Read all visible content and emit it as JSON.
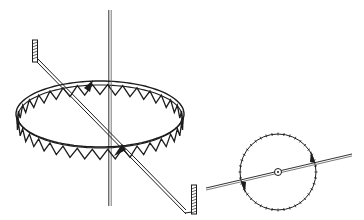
{
  "figure": {
    "colors": {
      "ink": "#1c1c1c",
      "background": "#ffffff",
      "gray_line": "#6a6a6a"
    },
    "main_view": {
      "vertical_rod": {
        "x": 110,
        "y_top": 10,
        "y_bottom": 206
      },
      "ring": {
        "cx": 100,
        "cy": 114,
        "rx": 84,
        "ry": 33,
        "tooth_count": 34
      },
      "diagonal_bar": {
        "start": [
          37,
          60
        ],
        "end": [
          186,
          212
        ],
        "left_hook_top": [
          35,
          40
        ],
        "right_hook_top": [
          194,
          185
        ]
      },
      "markers": [
        {
          "type": "triangle",
          "at": [
            84,
            88
          ]
        },
        {
          "type": "triangle",
          "at": [
            126,
            150
          ]
        }
      ]
    },
    "inset_view": {
      "circle": {
        "cx": 278,
        "cy": 172,
        "r": 38,
        "tick_count": 40
      },
      "center_mark": {
        "cx": 278,
        "cy": 172,
        "r": 3.5
      },
      "axis_line": {
        "start": [
          206,
          189
        ],
        "end": [
          352,
          155
        ]
      },
      "markers": [
        {
          "type": "triangle",
          "at": [
            241,
            181
          ]
        },
        {
          "type": "triangle",
          "at": [
            315,
            163
          ]
        }
      ]
    }
  }
}
